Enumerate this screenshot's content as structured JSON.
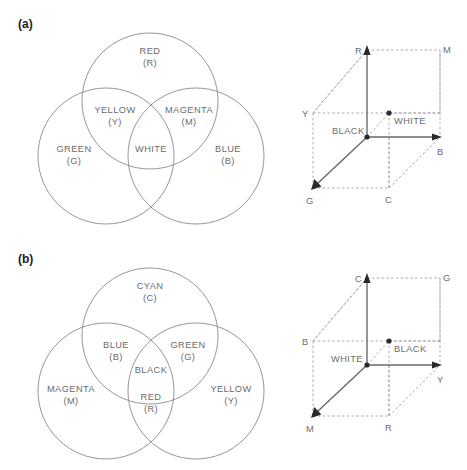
{
  "figure": {
    "width": 467,
    "height": 470,
    "background": "#ffffff",
    "line_color": "#8a8a8a",
    "text_color": "#6b6b6b",
    "label_color": "#1c1c1c"
  },
  "panels": [
    {
      "id": "a",
      "label": "(a)",
      "venn": {
        "title": "additive-primaries-venn",
        "circles": [
          {
            "name": "red-circle",
            "cx": 150,
            "cy": 101,
            "r": 68
          },
          {
            "name": "green-circle",
            "cx": 106,
            "cy": 156,
            "r": 68
          },
          {
            "name": "blue-circle",
            "cx": 196,
            "cy": 156,
            "r": 68
          }
        ],
        "labels": [
          {
            "name": "red-label",
            "line1": "RED",
            "line2": "(R)",
            "x": 150,
            "y": 54
          },
          {
            "name": "yellow-label",
            "line1": "YELLOW",
            "line2": "(Y)",
            "x": 115,
            "y": 113
          },
          {
            "name": "magenta-label",
            "line1": "MAGENTA",
            "line2": "(M)",
            "x": 188,
            "y": 113
          },
          {
            "name": "white-label",
            "line1": "WHITE",
            "line2": "",
            "x": 151,
            "y": 152
          },
          {
            "name": "green-label",
            "line1": "GREEN",
            "line2": "(G)",
            "x": 74,
            "y": 152
          },
          {
            "name": "blue-label",
            "line1": "BLUE",
            "line2": "(B)",
            "x": 228,
            "y": 152
          }
        ]
      },
      "cube": {
        "title": "rgb-color-cube",
        "origin_label": "BLACK",
        "center_label": "WHITE",
        "axes": [
          {
            "name": "axis-r",
            "label": "R"
          },
          {
            "name": "axis-b",
            "label": "B"
          },
          {
            "name": "axis-g",
            "label": "G"
          }
        ],
        "vertices": [
          {
            "name": "vertex-m",
            "label": "M"
          },
          {
            "name": "vertex-y",
            "label": "Y"
          },
          {
            "name": "vertex-c",
            "label": "C"
          }
        ]
      }
    },
    {
      "id": "b",
      "label": "(b)",
      "venn": {
        "title": "subtractive-primaries-venn",
        "circles": [
          {
            "name": "cyan-circle",
            "cx": 150,
            "cy": 336,
            "r": 68
          },
          {
            "name": "magenta-circle",
            "cx": 106,
            "cy": 391,
            "r": 68
          },
          {
            "name": "yellow-circle",
            "cx": 196,
            "cy": 391,
            "r": 68
          }
        ],
        "labels": [
          {
            "name": "cyan-label",
            "line1": "CYAN",
            "line2": "(C)",
            "x": 150,
            "y": 289
          },
          {
            "name": "blue-label",
            "line1": "BLUE",
            "line2": "(B)",
            "x": 115,
            "y": 348
          },
          {
            "name": "green-label",
            "line1": "GREEN",
            "line2": "(G)",
            "x": 188,
            "y": 348
          },
          {
            "name": "black-label",
            "line1": "BLACK",
            "line2": "",
            "x": 151,
            "y": 372
          },
          {
            "name": "red-label",
            "line1": "RED",
            "line2": "(R)",
            "x": 151,
            "y": 400
          },
          {
            "name": "magenta-label",
            "line1": "MAGENTA",
            "line2": "(M)",
            "x": 71,
            "y": 392
          },
          {
            "name": "yellow-label",
            "line1": "YELLOW",
            "line2": "(Y)",
            "x": 231,
            "y": 392
          }
        ]
      },
      "cube": {
        "title": "cmy-color-cube",
        "origin_label": "WHITE",
        "center_label": "BLACK",
        "axes": [
          {
            "name": "axis-c",
            "label": "C"
          },
          {
            "name": "axis-y",
            "label": "Y"
          },
          {
            "name": "axis-m",
            "label": "M"
          }
        ],
        "vertices": [
          {
            "name": "vertex-g",
            "label": "G"
          },
          {
            "name": "vertex-b",
            "label": "B"
          },
          {
            "name": "vertex-r",
            "label": "R"
          }
        ]
      }
    }
  ]
}
